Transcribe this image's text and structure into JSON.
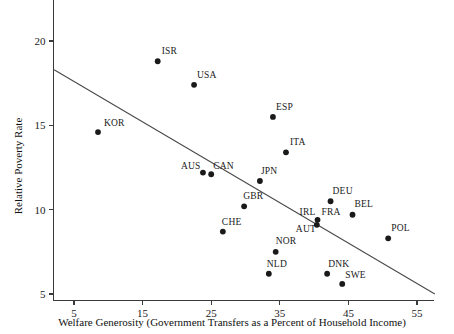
{
  "figure": {
    "title": "",
    "background": "#ffffff",
    "point_color": "#1a1a1a",
    "line_color": "#4a4a4a",
    "axis_color": "#3a3a3a"
  },
  "chart_data": {
    "type": "scatter",
    "title": "",
    "subtitle": "",
    "xlabel": "Welfare Generosity (Government Transfers as a Percent of Household Income)",
    "ylabel": "Relative Poverty Rate",
    "xlim": [
      2.0,
      57.5
    ],
    "ylim": [
      4.6,
      21.0
    ],
    "xticks": [
      5,
      15,
      25,
      35,
      45,
      55
    ],
    "xticklabels": [
      "5",
      "15",
      "25",
      "35",
      "45",
      "55"
    ],
    "yticks": [
      5,
      10,
      15,
      20
    ],
    "yticklabels": [
      "5",
      "10",
      "15",
      "20"
    ],
    "grid": false,
    "legend": false,
    "legend_position": "none",
    "annotations": [],
    "points": [
      {
        "label": "KOR",
        "x": 8.5,
        "y": 14.6,
        "label_dx": 6,
        "label_dy": -6
      },
      {
        "label": "ISR",
        "x": 17.2,
        "y": 18.8,
        "label_dx": 4,
        "label_dy": -7
      },
      {
        "label": "USA",
        "x": 22.5,
        "y": 17.4,
        "label_dx": 3,
        "label_dy": -7
      },
      {
        "label": "AUS",
        "x": 23.8,
        "y": 12.2,
        "label_dx": -22,
        "label_dy": -4
      },
      {
        "label": "CAN",
        "x": 25.0,
        "y": 12.1,
        "label_dx": 2,
        "label_dy": -5
      },
      {
        "label": "CHE",
        "x": 26.7,
        "y": 8.7,
        "label_dx": -1,
        "label_dy": -7
      },
      {
        "label": "GBR",
        "x": 29.8,
        "y": 10.2,
        "label_dx": -1,
        "label_dy": -7
      },
      {
        "label": "NLD",
        "x": 33.4,
        "y": 6.2,
        "label_dx": -2,
        "label_dy": -7
      },
      {
        "label": "JPN",
        "x": 32.1,
        "y": 11.7,
        "label_dx": 1,
        "label_dy": -7
      },
      {
        "label": "NOR",
        "x": 34.4,
        "y": 7.5,
        "label_dx": 0,
        "label_dy": -8
      },
      {
        "label": "ESP",
        "x": 34.0,
        "y": 15.5,
        "label_dx": 3,
        "label_dy": -7
      },
      {
        "label": "ITA",
        "x": 35.9,
        "y": 13.4,
        "label_dx": 4,
        "label_dy": -7
      },
      {
        "label": "IRL",
        "x": 40.5,
        "y": 9.4,
        "label_dx": -18,
        "label_dy": -5
      },
      {
        "label": "FRA",
        "x": 40.5,
        "y": 9.4,
        "label_dx": 4,
        "label_dy": -5
      },
      {
        "label": "AUT",
        "x": 40.4,
        "y": 9.1,
        "label_dx": -21,
        "label_dy": 7
      },
      {
        "label": "DEU",
        "x": 42.4,
        "y": 10.5,
        "label_dx": 2,
        "label_dy": -7
      },
      {
        "label": "DNK",
        "x": 41.9,
        "y": 6.2,
        "label_dx": 1,
        "label_dy": -7
      },
      {
        "label": "SWE",
        "x": 44.1,
        "y": 5.6,
        "label_dx": 3,
        "label_dy": -6
      },
      {
        "label": "BEL",
        "x": 45.6,
        "y": 9.7,
        "label_dx": 2,
        "label_dy": -8
      },
      {
        "label": "POL",
        "x": 50.8,
        "y": 8.3,
        "label_dx": 3,
        "label_dy": -7
      }
    ],
    "trend_line": {
      "x_start": 2.1,
      "y_start": 18.3,
      "x_end": 57.6,
      "y_end": 5.0
    }
  }
}
